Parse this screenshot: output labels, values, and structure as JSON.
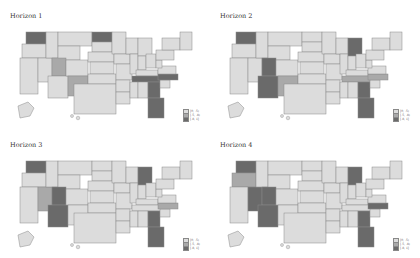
{
  "colors": {
    "low": "#dcdcdc",
    "mid": "#a9a9a9",
    "high": "#6a6a6a",
    "border": "#8a8a8a"
  },
  "legend": [
    "[0, .5)",
    "[.5, .8)",
    "[.8, 1]"
  ],
  "panels": [
    {
      "title": "Horizon 1",
      "mid": [
        "UT",
        "NM"
      ],
      "high": [
        "WA",
        "ND",
        "TN",
        "NC",
        "GA",
        "FL"
      ]
    },
    {
      "title": "Horizon 2",
      "mid": [
        "NM",
        "TN",
        "NC"
      ],
      "high": [
        "WA",
        "UT",
        "AZ",
        "MI",
        "GA",
        "FL"
      ]
    },
    {
      "title": "Horizon 3",
      "mid": [
        "NV",
        "NC"
      ],
      "high": [
        "WA",
        "UT",
        "AZ",
        "MI",
        "GA",
        "FL"
      ]
    },
    {
      "title": "Horizon 4",
      "mid": [
        "OR"
      ],
      "high": [
        "WA",
        "NV",
        "UT",
        "AZ",
        "MI",
        "NC",
        "GA",
        "FL"
      ]
    }
  ]
}
